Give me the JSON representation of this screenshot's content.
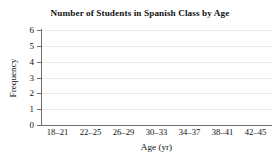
{
  "chart_data": {
    "type": "bar",
    "title": "Number of Students in Spanish Class by Age",
    "xlabel": "Age (yr)",
    "ylabel": "Frequency",
    "categories": [
      "18–21",
      "22–25",
      "26–29",
      "30–33",
      "34–37",
      "38–41",
      "42–45"
    ],
    "values": [
      null,
      null,
      null,
      null,
      null,
      null,
      null
    ],
    "series": [
      {
        "name": "Frequency",
        "values": [
          null,
          null,
          null,
          null,
          null,
          null,
          null
        ]
      }
    ],
    "ylim": [
      0,
      6
    ],
    "ytick_labels": [
      "0",
      "1",
      "2",
      "3",
      "4",
      "5",
      "6"
    ],
    "ytick_values": [
      0,
      1,
      2,
      3,
      4,
      5,
      6
    ],
    "grid": true,
    "grid_axis": "y",
    "legend": false,
    "legend_position": "none",
    "annotations": [],
    "note": "Empty plot frame: axes and gridlines drawn, no bars plotted",
    "colors": {
      "background": "#ffffff",
      "gridline": "#e9e9e9",
      "axis": "#6e6e6e",
      "text": "#111111"
    }
  }
}
